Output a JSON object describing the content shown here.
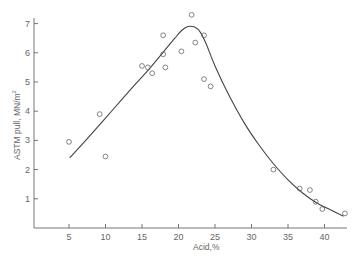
{
  "chart_data": {
    "type": "scatter",
    "title": "",
    "xlabel": "Acid,%",
    "ylabel": "ASTM pull, MN/m²",
    "ylabel_main": "ASTM pull, MN/m",
    "ylabel_sup": "2",
    "xlim": [
      0,
      43.5
    ],
    "ylim": [
      0,
      7.3
    ],
    "x_ticks": [
      5,
      10,
      15,
      20,
      25,
      30,
      35,
      40
    ],
    "x_tick_labels": [
      "5",
      "10",
      "15",
      "20",
      "25",
      "30",
      "35",
      "40"
    ],
    "y_ticks": [
      1,
      2,
      3,
      4,
      5,
      6,
      7
    ],
    "y_tick_labels": [
      "1",
      "2",
      "3",
      "4",
      "5",
      "6",
      "7"
    ],
    "grid": false,
    "legend": null,
    "series": [
      {
        "name": "measured",
        "style": "open-circle",
        "points": [
          [
            5.0,
            2.95
          ],
          [
            9.2,
            3.9
          ],
          [
            10.0,
            2.45
          ],
          [
            15.0,
            5.55
          ],
          [
            15.8,
            5.5
          ],
          [
            16.4,
            5.3
          ],
          [
            17.9,
            6.6
          ],
          [
            17.9,
            5.95
          ],
          [
            18.2,
            5.5
          ],
          [
            20.4,
            6.05
          ],
          [
            21.8,
            7.3
          ],
          [
            22.3,
            6.35
          ],
          [
            23.5,
            6.6
          ],
          [
            23.5,
            5.1
          ],
          [
            24.4,
            4.85
          ],
          [
            33.0,
            2.0
          ],
          [
            36.6,
            1.35
          ],
          [
            38.0,
            1.3
          ],
          [
            38.8,
            0.9
          ],
          [
            39.7,
            0.65
          ],
          [
            42.8,
            0.5
          ]
        ]
      },
      {
        "name": "fitted curve",
        "style": "line",
        "points": [
          [
            5.1,
            2.4
          ],
          [
            8,
            3.2
          ],
          [
            11,
            4.05
          ],
          [
            14,
            4.9
          ],
          [
            16,
            5.45
          ],
          [
            18,
            6.05
          ],
          [
            19.5,
            6.5
          ],
          [
            20.5,
            6.78
          ],
          [
            21.3,
            6.9
          ],
          [
            22.2,
            6.88
          ],
          [
            23.0,
            6.7
          ],
          [
            23.8,
            6.3
          ],
          [
            25,
            5.55
          ],
          [
            27,
            4.5
          ],
          [
            29,
            3.6
          ],
          [
            31,
            2.85
          ],
          [
            33,
            2.2
          ],
          [
            35,
            1.65
          ],
          [
            37,
            1.2
          ],
          [
            39,
            0.85
          ],
          [
            41,
            0.6
          ],
          [
            42.6,
            0.4
          ]
        ]
      }
    ]
  }
}
